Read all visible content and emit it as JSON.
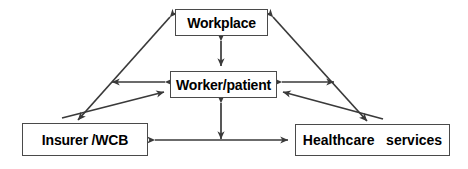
{
  "diagram": {
    "type": "relationship-diagram",
    "background_color": "#ffffff",
    "line_color": "#3a3a3a",
    "box_border_color": "#4a4a4a",
    "text_color": "#000000",
    "nodes": [
      {
        "id": "workplace",
        "label": "Workplace"
      },
      {
        "id": "worker",
        "label": "Worker/patient"
      },
      {
        "id": "insurer",
        "label": "Insurer /WCB"
      },
      {
        "id": "healthcare",
        "label": "Healthcare   services"
      }
    ],
    "connections": [
      {
        "id": "workplace-worker",
        "from": "workplace",
        "to": "worker",
        "style": "double-arrow",
        "orientation": "vertical"
      },
      {
        "id": "worker-bottom",
        "from": "worker",
        "to": "bottom-axis",
        "style": "double-arrow",
        "orientation": "vertical"
      },
      {
        "id": "insurer-healthcare",
        "from": "insurer",
        "to": "healthcare",
        "style": "double-arrow",
        "orientation": "horizontal"
      },
      {
        "id": "workplace-insurer",
        "from": "workplace",
        "to": "insurer",
        "style": "double-arrow",
        "orientation": "diagonal"
      },
      {
        "id": "workplace-healthcare",
        "from": "workplace",
        "to": "healthcare",
        "style": "double-arrow",
        "orientation": "diagonal"
      },
      {
        "id": "worker-left",
        "from": "worker",
        "to": "left-diagonal",
        "style": "double-arrow",
        "orientation": "horizontal"
      },
      {
        "id": "worker-right",
        "from": "worker",
        "to": "right-diagonal",
        "style": "double-arrow",
        "orientation": "horizontal"
      },
      {
        "id": "insurer-worker",
        "from": "insurer",
        "to": "worker",
        "style": "arrow",
        "orientation": "diagonal"
      },
      {
        "id": "healthcare-worker",
        "from": "healthcare",
        "to": "worker",
        "style": "arrow",
        "orientation": "diagonal"
      }
    ]
  }
}
